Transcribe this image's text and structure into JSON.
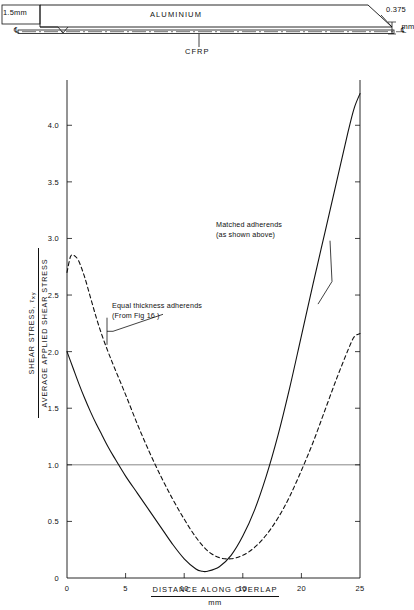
{
  "diagram": {
    "name": "bonded-lap-joint-specimen",
    "top_adherend_label": "ALUMINIUM",
    "adhesive_label": "CFRP",
    "left_thickness": "1.5mm",
    "right_thickness_value": "0.375",
    "right_thickness_unit": "mm",
    "centreline_symbol_left": "℄",
    "centreline_symbol_right": "℄"
  },
  "chart_data": {
    "type": "line",
    "title": "",
    "xlabel": "DISTANCE  ALONG  OVERLAP",
    "xlabel_unit": "mm",
    "ylabel_numerator": "SHEAR  STRESS,",
    "ylabel_numerator_symbol": "τ",
    "ylabel_numerator_subscript": "xy",
    "ylabel_denominator": "AVERAGE  APPLIED  SHEAR  STRESS",
    "xlim": [
      0,
      25
    ],
    "ylim": [
      0,
      4.4
    ],
    "xticks": [
      0,
      5,
      10,
      15,
      20,
      25
    ],
    "xtick_labels": [
      "0",
      "5",
      "10",
      "15",
      "20",
      "25"
    ],
    "yticks": [
      0,
      0.5,
      1.0,
      1.5,
      2.0,
      2.5,
      3.0,
      3.5,
      4.0
    ],
    "ytick_labels": [
      "0",
      "0.5",
      "1.0",
      "1.5",
      "2.0",
      "2.5",
      "3.0",
      "3.5",
      "4.0"
    ],
    "grid": false,
    "reference_line_y": 1.0,
    "legend": "annotations",
    "series": [
      {
        "name": "Matched adherends",
        "style": "solid",
        "annotation": "Matched adherends\n(as shown above)",
        "x": [
          0,
          0.5,
          1,
          1.5,
          2,
          2.5,
          3,
          3.5,
          4,
          5,
          6,
          7,
          8,
          9,
          10,
          11,
          11.5,
          12,
          13,
          14,
          15,
          16,
          17,
          18,
          19,
          20,
          21,
          22,
          23,
          24,
          24.5,
          25
        ],
        "y": [
          2.0,
          1.86,
          1.72,
          1.59,
          1.47,
          1.36,
          1.26,
          1.16,
          1.07,
          0.9,
          0.75,
          0.6,
          0.45,
          0.3,
          0.17,
          0.08,
          0.06,
          0.06,
          0.1,
          0.2,
          0.37,
          0.6,
          0.9,
          1.26,
          1.68,
          2.14,
          2.6,
          3.05,
          3.5,
          3.95,
          4.15,
          4.28
        ]
      },
      {
        "name": "Equal thickness adherends",
        "style": "dashed",
        "annotation": "Equal thickness adherends\n(From Fig 16 )",
        "x": [
          0,
          0.3,
          0.6,
          1,
          1.5,
          2,
          2.5,
          3,
          3.5,
          4,
          5,
          6,
          7,
          8,
          9,
          10,
          11,
          12,
          13,
          14,
          15,
          16,
          17,
          18,
          19,
          20,
          21,
          22,
          23,
          24,
          24.5,
          25
        ],
        "y": [
          2.7,
          2.84,
          2.85,
          2.8,
          2.66,
          2.48,
          2.3,
          2.14,
          2.0,
          1.87,
          1.62,
          1.36,
          1.12,
          0.9,
          0.7,
          0.52,
          0.36,
          0.24,
          0.18,
          0.17,
          0.2,
          0.27,
          0.38,
          0.53,
          0.72,
          0.95,
          1.2,
          1.48,
          1.76,
          2.02,
          2.13,
          2.16
        ]
      }
    ]
  }
}
